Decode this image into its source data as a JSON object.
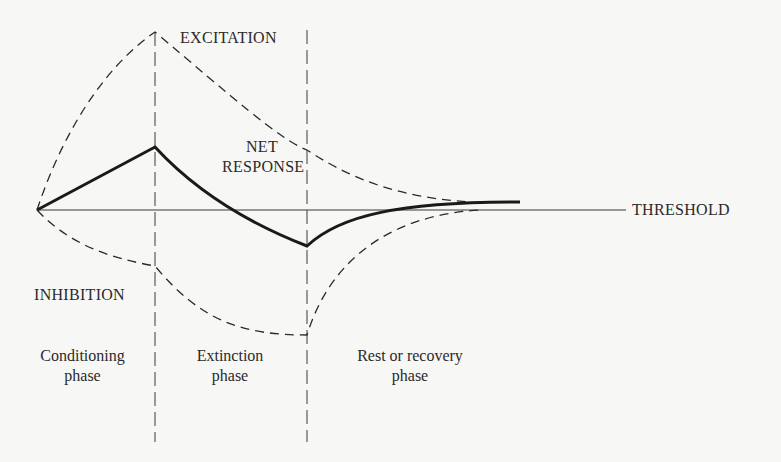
{
  "diagram": {
    "type": "phase diagram of conditioning",
    "curves": [
      {
        "name": "EXCITATION",
        "style": "dashed",
        "points_desc": "rises from origin to peak at end of conditioning, decays toward threshold during extinction and rest"
      },
      {
        "name": "NET RESPONSE",
        "style": "solid bold",
        "points_desc": "rises to peak at end of conditioning, falls below threshold during extinction, recovers to threshold during rest"
      },
      {
        "name": "INHIBITION",
        "style": "dashed",
        "points_desc": "falls below threshold during conditioning, deepest at end of extinction, recovers toward threshold during rest"
      }
    ],
    "reference_line": "THRESHOLD"
  },
  "labels": {
    "excitation": "EXCITATION",
    "net_response_line1": "NET",
    "net_response_line2": "RESPONSE",
    "threshold": "THRESHOLD",
    "inhibition": "INHIBITION"
  },
  "phases": [
    {
      "line1": "Conditioning",
      "line2": "phase"
    },
    {
      "line1": "Extinction",
      "line2": "phase"
    },
    {
      "line1": "Rest or recovery",
      "line2": "phase"
    }
  ],
  "colors": {
    "background": "#f7f7f5",
    "ink": "#2a2a2a"
  }
}
